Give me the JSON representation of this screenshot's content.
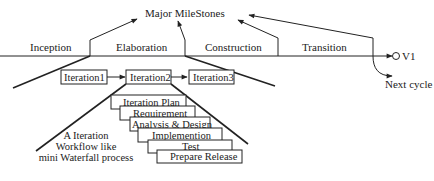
{
  "title": "Major MileStones",
  "phases": [
    {
      "label": "Inception"
    },
    {
      "label": "Elaboration"
    },
    {
      "label": "Construction"
    },
    {
      "label": "Transition"
    }
  ],
  "release": {
    "label": "V1"
  },
  "next_cycle": {
    "label": "Next cycle"
  },
  "iterations": [
    {
      "label": "Iteration1"
    },
    {
      "label": "Iteration2"
    },
    {
      "label": "Iteration3"
    }
  ],
  "workflow_steps": [
    {
      "label": "Iteration Plan"
    },
    {
      "label": "Requirement"
    },
    {
      "label": "Analysis & Design"
    },
    {
      "label": "Implemention"
    },
    {
      "label": "Test"
    },
    {
      "label": "Prepare Release"
    }
  ],
  "annotation": {
    "lines": [
      "A Iteration",
      "Workflow like",
      "mini Waterfall process"
    ]
  },
  "colors": {
    "stroke": "#222222",
    "background": "#ffffff"
  }
}
